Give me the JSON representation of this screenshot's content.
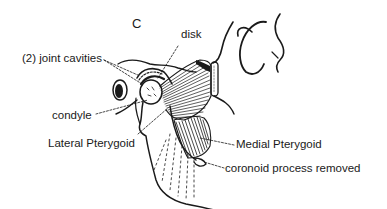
{
  "diagram": {
    "panel_letter": "C",
    "labels": {
      "disk": "disk",
      "joint_cavities": "(2) joint cavities",
      "condyle": "condyle",
      "lateral_pterygoid": "Lateral Pterygoid",
      "medial_pterygoid": "Medial Pterygoid",
      "coronoid": "coronoid process removed"
    },
    "colors": {
      "ink": "#1a1a1a",
      "background": "#ffffff"
    }
  }
}
